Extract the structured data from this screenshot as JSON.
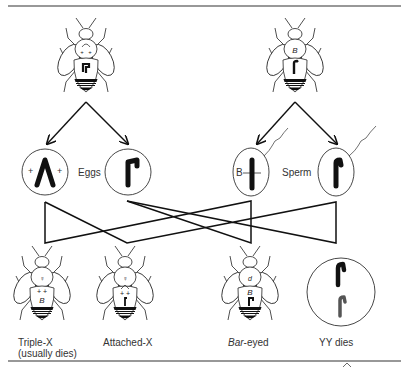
{
  "diagram": {
    "parents": {
      "female": {
        "thorax_mark": "++",
        "abdomen_mark": "X chromosome (attached)"
      },
      "male": {
        "thorax_mark": "B",
        "abdomen_mark": "Y chromosome"
      }
    },
    "gamete_labels": {
      "eggs": "Eggs",
      "sperm": "Sperm"
    },
    "sperm_b_label": "B",
    "egg_plus_left": "+",
    "egg_plus_right": "+",
    "offspring": [
      {
        "label_line1": "Triple-X",
        "label_line2": "(usually dies)",
        "sex_symbol": "♀",
        "marks": "+ +",
        "gene": "B"
      },
      {
        "label_line1": "Attached-X",
        "label_line2": "",
        "sex_symbol": "♀",
        "marks": "+ +",
        "gene": ""
      },
      {
        "label_italic": "Bar",
        "label_rest": "-eyed",
        "sex_symbol": "♂",
        "gene": "B"
      },
      {
        "label_line1": "YY dies"
      }
    ],
    "footer_glyph": "^"
  }
}
